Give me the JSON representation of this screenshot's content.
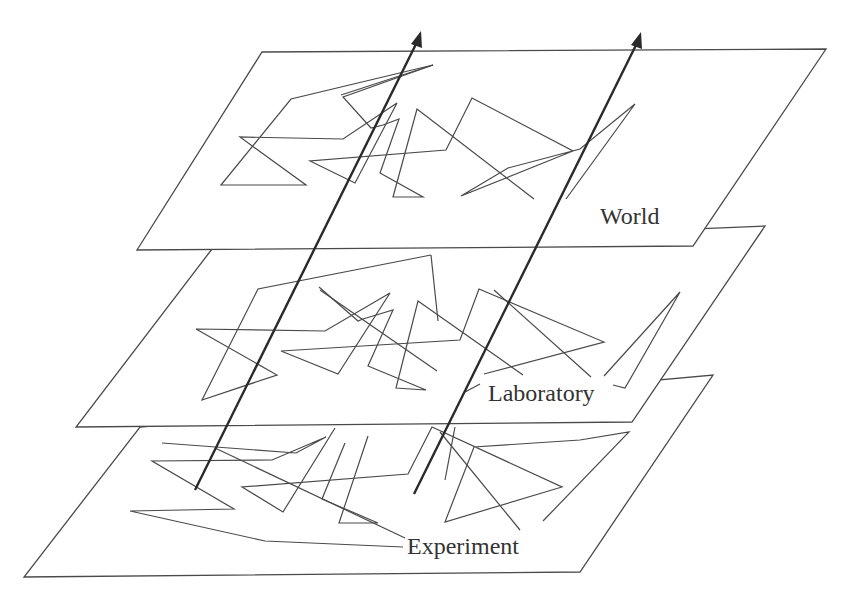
{
  "diagram": {
    "type": "layered-planes",
    "colors": {
      "line": "#4a4a4a",
      "arrow": "#2a2a2a",
      "label": "#333333",
      "background": "#ffffff"
    },
    "planes": [
      {
        "id": "world",
        "label": "World",
        "label_pos": [
          600,
          224
        ],
        "corners": [
          [
            262,
            52
          ],
          [
            826,
            49
          ],
          [
            693,
            246
          ],
          [
            137,
            250
          ]
        ],
        "path": [
          [
            464,
            65
          ],
          [
            329,
            93
          ],
          [
            221,
            185
          ],
          [
            303,
            185
          ],
          [
            213,
            137
          ],
          [
            343,
            139
          ],
          [
            394,
            103
          ],
          [
            355,
            183
          ],
          [
            309,
            160
          ],
          [
            446,
            150
          ],
          [
            478,
            98
          ],
          [
            571,
            151
          ],
          [
            461,
            196
          ],
          [
            534,
            168
          ],
          [
            634,
            113
          ],
          [
            675,
            104
          ],
          [
            598,
            199
          ]
        ],
        "path2": [
          [
            464,
            65
          ],
          [
            340,
            96
          ],
          [
            371,
            121
          ],
          [
            387,
            118
          ],
          [
            395,
            107
          ],
          [
            380,
            164
          ],
          [
            392,
            162
          ],
          [
            416,
            197
          ],
          [
            393,
            178
          ],
          [
            400,
            175
          ],
          [
            421,
            108
          ],
          [
            567,
            188
          ]
        ]
      },
      {
        "id": "laboratory",
        "label": "Laboratory",
        "label_pos": [
          488,
          401
        ],
        "corners": [
          [
            212,
            249
          ],
          [
            765,
            226
          ],
          [
            632,
            422
          ],
          [
            76,
            427
          ]
        ],
        "path": [
          [
            355,
            255
          ],
          [
            223,
            289
          ],
          [
            177,
            402
          ],
          [
            237,
            375
          ],
          [
            173,
            329
          ],
          [
            273,
            330
          ],
          [
            321,
            293
          ],
          [
            283,
            373
          ],
          [
            202,
            351
          ],
          [
            369,
            338
          ],
          [
            392,
            289
          ],
          [
            476,
            322
          ],
          [
            366,
            363
          ],
          [
            420,
            356
          ],
          [
            553,
            369
          ]
        ],
        "path2": [
          [
            267,
            286
          ],
          [
            323,
            319
          ],
          [
            328,
            316
          ],
          [
            340,
            309
          ],
          [
            330,
            338
          ],
          [
            392,
            391
          ],
          [
            352,
            396
          ],
          [
            379,
            335
          ],
          [
            398,
            340
          ],
          [
            449,
            375
          ]
        ],
        "tail": [
          [
            587,
            375
          ],
          [
            628,
            292
          ],
          [
            602,
            386
          ],
          [
            572,
            385
          ]
        ]
      },
      {
        "id": "experiment",
        "label": "Experiment",
        "label_pos": [
          407,
          554
        ],
        "corners": [
          [
            140,
            427
          ],
          [
            713,
            375
          ],
          [
            580,
            572
          ],
          [
            24,
            577
          ]
        ],
        "path": [
          [
            162,
            443
          ],
          [
            311,
            455
          ],
          [
            331,
            443
          ],
          [
            321,
            444
          ],
          [
            258,
            465
          ],
          [
            152,
            463
          ],
          [
            234,
            510
          ],
          [
            130,
            511
          ],
          [
            265,
            541
          ],
          [
            403,
            547
          ]
        ],
        "path2": [
          [
            316,
            442
          ],
          [
            342,
            452
          ],
          [
            305,
            512
          ],
          [
            258,
            486
          ],
          [
            408,
            473
          ],
          [
            430,
            427
          ],
          [
            541,
            475
          ],
          [
            419,
            520
          ],
          [
            536,
            504
          ],
          [
            583,
            457
          ],
          [
            634,
            432
          ],
          [
            545,
            521
          ]
        ],
        "path3": [
          [
            209,
            443
          ],
          [
            405,
            538
          ]
        ],
        "path4": [
          [
            368,
            435
          ],
          [
            336,
            521
          ],
          [
            373,
            520
          ],
          [
            321,
            499
          ],
          [
            347,
            446
          ],
          [
            364,
            443
          ]
        ],
        "path5": [
          [
            435,
            431
          ],
          [
            524,
            487
          ]
        ]
      }
    ],
    "arrows": [
      {
        "id": "arrow-left",
        "from": [
          195,
          490
        ],
        "to": [
          421,
          33
        ]
      },
      {
        "id": "arrow-right",
        "from": [
          414,
          494
        ],
        "to": [
          641,
          34
        ]
      }
    ]
  }
}
